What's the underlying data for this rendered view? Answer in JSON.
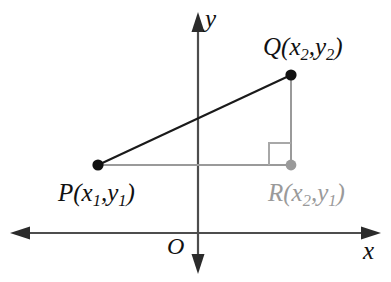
{
  "diagram": {
    "axes": {
      "x_label": "x",
      "y_label": "y",
      "origin_label": "O",
      "x_axis_name": "x-axis",
      "y_axis_name": "y-axis"
    },
    "colors": {
      "hypotenuse": "#1a1a1a",
      "legs": "#9a9a9a",
      "axis": "#4d4d4d",
      "point_black": "#111111",
      "point_gray": "#9a9a9a",
      "right_angle": "#a8a8a8",
      "background": "#ffffff",
      "label_black": "#111111",
      "label_gray": "#9a9a9a"
    },
    "points": [
      {
        "id": "P",
        "name": "P",
        "label": "P(x1,y1)",
        "letter": "P",
        "x_coord": "x",
        "x_sub": "1",
        "y_coord": "y",
        "y_sub": "1",
        "color": "#111111",
        "px": 98,
        "py": 165
      },
      {
        "id": "Q",
        "name": "Q",
        "label": "Q(x2,y2)",
        "letter": "Q",
        "x_coord": "x",
        "x_sub": "2",
        "y_coord": "y",
        "y_sub": "2",
        "color": "#111111",
        "px": 291,
        "py": 75
      },
      {
        "id": "R",
        "name": "R",
        "label": "R(x2,y1)",
        "letter": "R",
        "x_coord": "x",
        "x_sub": "2",
        "y_coord": "y",
        "y_sub": "1",
        "color": "#9a9a9a",
        "px": 291,
        "py": 165
      }
    ],
    "segments": [
      {
        "name": "hypotenuse-PQ",
        "from": "P",
        "to": "Q",
        "color": "#1a1a1a"
      },
      {
        "name": "horizontal-leg-PR",
        "from": "P",
        "to": "R",
        "color": "#9a9a9a"
      },
      {
        "name": "vertical-leg-QR",
        "from": "Q",
        "to": "R",
        "color": "#9a9a9a"
      }
    ],
    "right_angle": {
      "name": "right-angle-marker-at-R",
      "vertex": "R",
      "size": 22,
      "color": "#a8a8a8"
    }
  }
}
